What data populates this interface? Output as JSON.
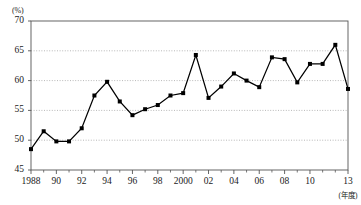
{
  "chart_data": {
    "type": "line",
    "title": "",
    "subtitle": "",
    "xlabel": "(年度)",
    "ylabel": "(%)",
    "ylim": [
      45,
      70
    ],
    "xlim": [
      1988,
      2013
    ],
    "grid": true,
    "grid_axis": "y",
    "legend": false,
    "marker": "square",
    "marker_color": "#000000",
    "line_color": "#000000",
    "x": [
      1988,
      1989,
      1990,
      1991,
      1992,
      1993,
      1994,
      1995,
      1996,
      1997,
      1998,
      1999,
      2000,
      2001,
      2002,
      2003,
      2004,
      2005,
      2006,
      2007,
      2008,
      2009,
      2010,
      2011,
      2012,
      2013
    ],
    "values": [
      48.5,
      51.5,
      49.8,
      49.8,
      52.0,
      57.5,
      59.8,
      56.5,
      54.2,
      55.2,
      55.9,
      57.5,
      57.9,
      64.3,
      57.1,
      59.0,
      61.2,
      60.0,
      58.9,
      63.9,
      63.6,
      59.7,
      62.8,
      62.8,
      66.0,
      58.6
    ],
    "ytick_values": [
      45,
      50,
      55,
      60,
      65,
      70
    ],
    "ytick_labels": [
      "45",
      "50",
      "55",
      "60",
      "65",
      "70"
    ],
    "xtick_values": [
      1988,
      1990,
      1992,
      1994,
      1996,
      1998,
      2000,
      2002,
      2004,
      2006,
      2008,
      2010,
      2013
    ],
    "xtick_labels": [
      "1988",
      "90",
      "92",
      "94",
      "96",
      "98",
      "2000",
      "02",
      "04",
      "06",
      "08",
      "10",
      "13"
    ],
    "minor_xticks": [
      1989,
      1991,
      1993,
      1995,
      1997,
      1999,
      2001,
      2003,
      2005,
      2007,
      2009,
      2011,
      2012
    ],
    "axis_color": "#555555",
    "grid_color": "#999999",
    "background_color": "#ffffff"
  }
}
